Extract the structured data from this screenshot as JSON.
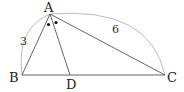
{
  "diagram": {
    "type": "triangle-angle-bisector",
    "vertices": {
      "A": {
        "label": "A",
        "x": 50,
        "y": 14
      },
      "B": {
        "label": "B",
        "x": 22,
        "y": 75
      },
      "C": {
        "label": "C",
        "x": 165,
        "y": 75
      },
      "D": {
        "label": "D",
        "x": 70,
        "y": 75
      }
    },
    "segments": [
      {
        "from": "A",
        "to": "B"
      },
      {
        "from": "A",
        "to": "C"
      },
      {
        "from": "B",
        "to": "C"
      },
      {
        "from": "A",
        "to": "D"
      }
    ],
    "lengths": {
      "AB": "3",
      "AC": "6"
    },
    "angle_marks": {
      "symbol": "dot",
      "count": 2,
      "meaning": "angle BAD = angle DAC"
    },
    "colors": {
      "line": "#444444",
      "arc": "#999999",
      "text": "#222222"
    }
  }
}
